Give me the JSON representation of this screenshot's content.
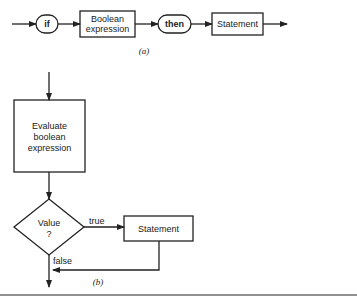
{
  "syntax_diagram": {
    "caption": "(a)",
    "nodes": [
      {
        "id": "if",
        "shape": "rounded",
        "label": "if"
      },
      {
        "id": "bool",
        "shape": "rect",
        "label_lines": [
          "Boolean",
          "expression"
        ]
      },
      {
        "id": "then",
        "shape": "rounded",
        "label": "then"
      },
      {
        "id": "stmt",
        "shape": "rect",
        "label": "Statement"
      }
    ]
  },
  "flowchart": {
    "caption": "(b)",
    "process": {
      "label_lines": [
        "Evaluate",
        "boolean",
        "expression"
      ]
    },
    "decision": {
      "label_lines": [
        "Value",
        "?"
      ]
    },
    "true_label": "true",
    "false_label": "false",
    "statement": {
      "label": "Statement"
    }
  },
  "colors": {
    "line": "#222222",
    "background": "#ffffff"
  }
}
